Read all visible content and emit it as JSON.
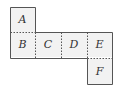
{
  "diagram": {
    "type": "cube-net",
    "cells": [
      {
        "label": "A",
        "col": 0,
        "row": 0
      },
      {
        "label": "B",
        "col": 0,
        "row": 1
      },
      {
        "label": "C",
        "col": 1,
        "row": 1
      },
      {
        "label": "D",
        "col": 2,
        "row": 1
      },
      {
        "label": "E",
        "col": 3,
        "row": 1
      },
      {
        "label": "F",
        "col": 3,
        "row": 2
      }
    ],
    "colors": {
      "fill": "#f2f2f2",
      "border": "#555555",
      "fold_line": "#555555"
    }
  }
}
